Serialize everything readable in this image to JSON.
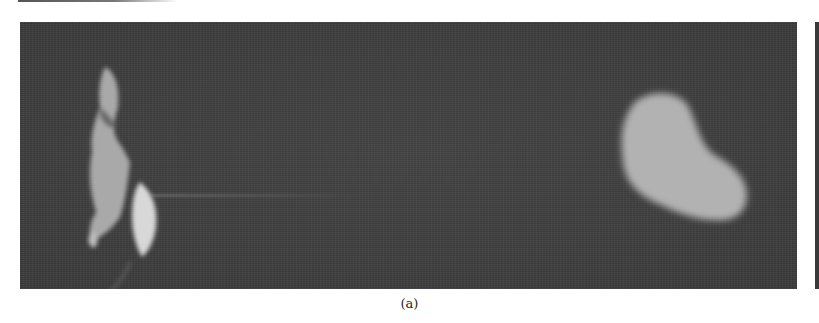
{
  "figure": {
    "panels": [
      {
        "id": "a",
        "caption": "(a)",
        "description": "Grayscale photograph: bright irregular object at left edge, faint horizontal streak, large bright bean-shaped blob at right on dark noisy background"
      },
      {
        "id": "b",
        "description": "Edge of adjacent panel, mostly cropped out"
      }
    ],
    "colors": {
      "background": "#3f3f3f",
      "blob_light": "#b4b4b4",
      "highlight": "#dcdcdc",
      "page": "#ffffff"
    }
  }
}
